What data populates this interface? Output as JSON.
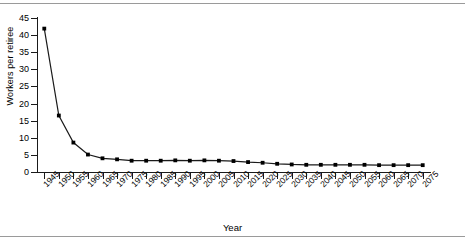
{
  "chart_data": {
    "type": "line",
    "title": "",
    "xlabel": "Year",
    "ylabel": "Workers per retiree",
    "grid": false,
    "legend": false,
    "ylim": [
      0,
      45
    ],
    "ytick_labels": [
      "0",
      "5",
      "10",
      "15",
      "20",
      "25",
      "30",
      "35",
      "40",
      "45"
    ],
    "ytick_values": [
      0,
      5,
      10,
      15,
      20,
      25,
      30,
      35,
      40,
      45
    ],
    "categories": [
      "1945",
      "1950",
      "1955",
      "1960",
      "1965",
      "1970",
      "1975",
      "1980",
      "1985",
      "1990",
      "1995",
      "2000",
      "2005",
      "2010",
      "2015",
      "2020",
      "2025",
      "2030",
      "2035",
      "2040",
      "2045",
      "2050",
      "2055",
      "2060",
      "2065",
      "2070",
      "2075"
    ],
    "values": [
      41.9,
      16.5,
      8.6,
      5.1,
      4.0,
      3.7,
      3.3,
      3.3,
      3.3,
      3.4,
      3.3,
      3.4,
      3.3,
      3.2,
      2.9,
      2.7,
      2.4,
      2.2,
      2.1,
      2.1,
      2.1,
      2.1,
      2.1,
      2.0,
      2.0,
      2.0,
      2.0
    ],
    "marker": "square",
    "line_color": "#1a1a1a",
    "marker_color": "#000000"
  },
  "figure": {
    "top_rule_color": "#9a9a9a",
    "bottom_rule_color": "#9a9a9a"
  }
}
